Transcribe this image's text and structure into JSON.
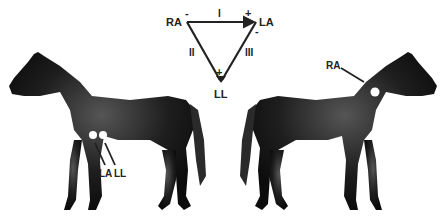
{
  "triangle": {
    "vertices": {
      "ra": "RA",
      "la": "LA",
      "ll": "LL"
    },
    "leads": {
      "lead1": "I",
      "lead2": "II",
      "lead3": "III"
    },
    "polarity": {
      "ra_minus": "-",
      "la_plus": "+",
      "la_minus": "-",
      "ll_plus": "+"
    }
  },
  "left_horse": {
    "electrodes": [
      {
        "label": "LA"
      },
      {
        "label": "LL"
      }
    ]
  },
  "right_horse": {
    "electrodes": [
      {
        "label": "RA"
      }
    ]
  },
  "colors": {
    "horse": "#1a1a1a",
    "lines": "#222222",
    "electrode": "#ffffff"
  }
}
